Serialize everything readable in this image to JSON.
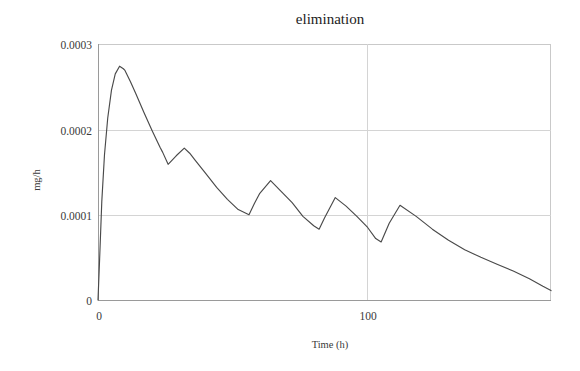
{
  "chart_data": {
    "type": "line",
    "title": "elimination",
    "xlabel": "Time (h)",
    "ylabel": "mg/h",
    "xlim": [
      0,
      168
    ],
    "ylim": [
      0,
      0.0003
    ],
    "grid": true,
    "legend": null,
    "x_ticks": [
      0,
      100
    ],
    "x_tick_labels": [
      "0",
      "100"
    ],
    "y_ticks": [
      0,
      0.0001,
      0.0002,
      0.0003
    ],
    "y_tick_labels": [
      "0",
      "0.0001",
      "0.0002",
      "0.0003"
    ],
    "series": [
      {
        "name": "elimination rate",
        "units": "mg/h",
        "x": [
          0,
          0.6,
          1.4,
          2.4,
          3.6,
          5.0,
          6.4,
          8.0,
          9.4,
          10.0,
          12.0,
          14.0,
          17.0,
          20.0,
          23.0,
          24.0,
          26.0,
          29.0,
          32.0,
          34.0,
          36.0,
          40.0,
          44.0,
          48.0,
          52.0,
          56.0,
          58.0,
          60.0,
          64.0,
          68.0,
          72.0,
          76.0,
          80.0,
          82.0,
          84.0,
          88.0,
          92.0,
          96.0,
          100.0,
          103.0,
          105.0,
          108.0,
          112.0,
          118.0,
          124.0,
          130.0,
          136.0,
          142.0,
          148.0,
          154.0,
          160.0,
          165.0,
          168.0
        ],
        "y": [
          0.0,
          4.8e-05,
          0.000115,
          0.00017,
          0.000213,
          0.000246,
          0.000265,
          0.000274,
          0.000271,
          0.000269,
          0.000256,
          0.000242,
          0.00022,
          0.000199,
          0.000179,
          0.000173,
          0.000159,
          0.000169,
          0.000178,
          0.000172,
          0.000164,
          0.000148,
          0.000132,
          0.000118,
          0.000106,
          0.0001,
          0.000113,
          0.000125,
          0.00014,
          0.000127,
          0.000114,
          9.8e-05,
          8.7e-05,
          8.3e-05,
          9.6e-05,
          0.00012,
          0.00011,
          9.8e-05,
          8.5e-05,
          7.2e-05,
          6.8e-05,
          9e-05,
          0.000111,
          9.8e-05,
          8.3e-05,
          7e-05,
          5.9e-05,
          5e-05,
          4.2e-05,
          3.4e-05,
          2.5e-05,
          1.6e-05,
          1.1e-05
        ]
      }
    ]
  },
  "figure": {
    "title": "elimination",
    "x_axis_label": "Time (h)",
    "y_axis_label": "mg/h",
    "y_tick_0": "0",
    "y_tick_1": "0.0001",
    "y_tick_2": "0.0002",
    "y_tick_3": "0.0003",
    "x_tick_0": "0",
    "x_tick_1": "100",
    "colors": {
      "curve": "#4a4a4a",
      "grid": "#d4d4d4",
      "axis": "#9a9a9a",
      "background": "#ffffff",
      "text": "#3a3a3a"
    }
  }
}
